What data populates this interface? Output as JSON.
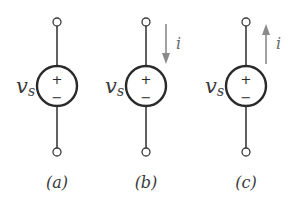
{
  "diagram": {
    "panels": [
      {
        "caption": "(a)",
        "source_label": "v",
        "source_subscript": "s",
        "plus_sign": "+",
        "minus_sign": "−",
        "current": null
      },
      {
        "caption": "(b)",
        "source_label": "v",
        "source_subscript": "s",
        "plus_sign": "+",
        "minus_sign": "−",
        "current": {
          "label": "i",
          "direction": "down"
        }
      },
      {
        "caption": "(c)",
        "source_label": "v",
        "source_subscript": "s",
        "plus_sign": "+",
        "minus_sign": "−",
        "current": {
          "label": "i",
          "direction": "up"
        }
      }
    ],
    "colors": {
      "wire": "#3a3a3a",
      "arrow": "#8a8a8a"
    }
  }
}
